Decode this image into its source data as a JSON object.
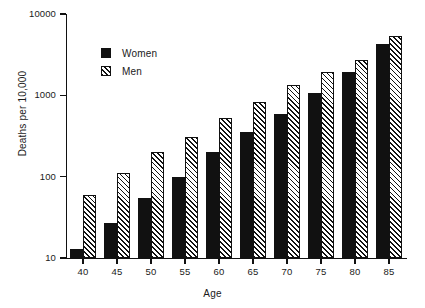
{
  "figure": {
    "background": "#ffffff",
    "ink": "#111111"
  },
  "axes": {
    "ylabel": "Deaths per 10,000",
    "xlabel": "Age",
    "yticks": [
      "10",
      "100",
      "1000",
      "10000"
    ],
    "ytick_values": [
      10,
      100,
      1000,
      10000
    ],
    "xticks": [
      "40",
      "45",
      "50",
      "55",
      "60",
      "65",
      "70",
      "75",
      "80",
      "85"
    ]
  },
  "legend": {
    "entries": [
      {
        "label": "Women",
        "swatch": "solid-black-square"
      },
      {
        "label": "Men",
        "swatch": "hatched-square"
      }
    ]
  },
  "caption": "",
  "chart_data": {
    "type": "bar",
    "title": "",
    "subtitle": "",
    "xlabel": "Age",
    "ylabel": "Deaths per 10,000",
    "yscale": "log",
    "ylim": [
      10,
      10000
    ],
    "grid": false,
    "legend_position": "upper-left-inside",
    "categories": [
      "40",
      "45",
      "50",
      "55",
      "60",
      "65",
      "70",
      "75",
      "80",
      "85"
    ],
    "series": [
      {
        "name": "Women",
        "color": "#111111",
        "fill": "solid",
        "values": [
          13,
          27,
          55,
          100,
          200,
          350,
          590,
          1080,
          1950,
          4300
        ]
      },
      {
        "name": "Men",
        "color": "#111111",
        "fill": "hatched",
        "values": [
          60,
          110,
          200,
          310,
          520,
          840,
          1350,
          1950,
          2750,
          5300
        ]
      }
    ]
  }
}
